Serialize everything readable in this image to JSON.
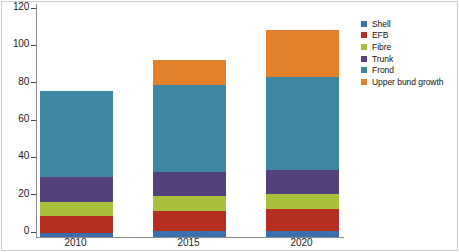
{
  "chart_data": {
    "type": "bar",
    "stacked": true,
    "title": "",
    "xlabel": "",
    "ylabel": "",
    "categories": [
      "2010",
      "2015",
      "2020"
    ],
    "ylim": [
      0,
      120
    ],
    "yticks": [
      0,
      20,
      40,
      60,
      80,
      100,
      120
    ],
    "ytick_labels": [
      "0",
      "20",
      "40",
      "60",
      "80",
      "100",
      "120"
    ],
    "grid": false,
    "legend_position": "right",
    "series": [
      {
        "name": "Shell",
        "color": "#3b6fb0",
        "values": [
          2,
          3,
          3
        ]
      },
      {
        "name": "EFB",
        "color": "#b42f21",
        "values": [
          9,
          11,
          12
        ]
      },
      {
        "name": "Fibre",
        "color": "#a8c03c",
        "values": [
          8,
          8,
          8
        ]
      },
      {
        "name": "Trunk",
        "color": "#54407a",
        "values": [
          13,
          13,
          13
        ]
      },
      {
        "name": "Frond",
        "color": "#3e87a2",
        "values": [
          46.5,
          46.5,
          50
        ]
      },
      {
        "name": "Upper bund growth",
        "color": "#e3802b",
        "values": [
          0,
          13.5,
          25
        ]
      }
    ],
    "totals": [
      78.5,
      95,
      111
    ]
  },
  "legend": {
    "items": [
      {
        "label": "Shell"
      },
      {
        "label": "EFB"
      },
      {
        "label": "Fibre"
      },
      {
        "label": "Trunk"
      },
      {
        "label": "Frond"
      },
      {
        "label": "Upper bund growth"
      }
    ]
  },
  "axis": {
    "y_labels": [
      "120",
      "100",
      "80",
      "60",
      "40",
      "20",
      "0"
    ],
    "x_labels": [
      "2010",
      "2015",
      "2020"
    ]
  }
}
